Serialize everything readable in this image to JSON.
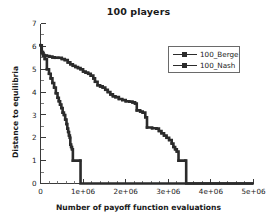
{
  "chart_data": {
    "type": "line",
    "title": "100 players",
    "xlabel": "Number of payoff function evaluations",
    "ylabel": "Distance to equilibria",
    "xlim": [
      0,
      5000000
    ],
    "ylim": [
      0,
      7
    ],
    "grid": false,
    "legend_position": "upper-right",
    "xticks": [
      0,
      1000000,
      2000000,
      3000000,
      4000000,
      5000000
    ],
    "xticklabels": [
      "0",
      "1e+06",
      "2e+06",
      "3e+06",
      "4e+06",
      "5e+06"
    ],
    "yticks": [
      0,
      1,
      2,
      3,
      4,
      5,
      6,
      7
    ],
    "yticklabels": [
      "0",
      "1",
      "2",
      "3",
      "4",
      "5",
      "6",
      "7"
    ],
    "series": [
      {
        "name": "100_Berge",
        "marker": "square-line",
        "color": "#2b2b2b",
        "points": [
          [
            0,
            6.05
          ],
          [
            20000,
            5.75
          ],
          [
            45000,
            5.7
          ],
          [
            70000,
            5.62
          ],
          [
            100000,
            5.6
          ],
          [
            150000,
            5.58
          ],
          [
            210000,
            5.55
          ],
          [
            280000,
            5.52
          ],
          [
            340000,
            5.5
          ],
          [
            420000,
            5.5
          ],
          [
            500000,
            5.45
          ],
          [
            570000,
            5.4
          ],
          [
            640000,
            5.3
          ],
          [
            700000,
            5.22
          ],
          [
            760000,
            5.15
          ],
          [
            820000,
            5.1
          ],
          [
            880000,
            5.05
          ],
          [
            940000,
            5.0
          ],
          [
            1000000,
            4.9
          ],
          [
            1060000,
            4.85
          ],
          [
            1120000,
            4.8
          ],
          [
            1180000,
            4.72
          ],
          [
            1240000,
            4.6
          ],
          [
            1280000,
            4.45
          ],
          [
            1340000,
            4.3
          ],
          [
            1400000,
            4.25
          ],
          [
            1460000,
            4.2
          ],
          [
            1520000,
            4.1
          ],
          [
            1580000,
            4.0
          ],
          [
            1640000,
            3.9
          ],
          [
            1700000,
            3.82
          ],
          [
            1760000,
            3.78
          ],
          [
            1840000,
            3.7
          ],
          [
            1920000,
            3.65
          ],
          [
            2000000,
            3.6
          ],
          [
            2080000,
            3.58
          ],
          [
            2160000,
            3.55
          ],
          [
            2220000,
            3.5
          ],
          [
            2260000,
            3.2
          ],
          [
            2340000,
            3.15
          ],
          [
            2400000,
            3.1
          ],
          [
            2460000,
            2.9
          ],
          [
            2500000,
            2.45
          ],
          [
            2620000,
            2.42
          ],
          [
            2720000,
            2.4
          ],
          [
            2780000,
            2.3
          ],
          [
            2840000,
            2.2
          ],
          [
            2900000,
            2.1
          ],
          [
            2960000,
            2.0
          ],
          [
            3020000,
            1.9
          ],
          [
            3080000,
            1.75
          ],
          [
            3120000,
            1.6
          ],
          [
            3160000,
            1.5
          ],
          [
            3200000,
            1.4
          ],
          [
            3240000,
            1.0
          ],
          [
            3400000,
            1.0
          ],
          [
            3420000,
            0.0
          ],
          [
            5000000,
            0.0
          ]
        ]
      },
      {
        "name": "100_Nash",
        "marker": "square-line",
        "color": "#2b2b2b",
        "points": [
          [
            0,
            6.05
          ],
          [
            30000,
            5.75
          ],
          [
            60000,
            5.6
          ],
          [
            100000,
            5.45
          ],
          [
            150000,
            5.0
          ],
          [
            200000,
            4.8
          ],
          [
            240000,
            4.6
          ],
          [
            280000,
            4.4
          ],
          [
            320000,
            4.2
          ],
          [
            360000,
            3.95
          ],
          [
            400000,
            3.75
          ],
          [
            430000,
            3.6
          ],
          [
            460000,
            3.45
          ],
          [
            490000,
            3.3
          ],
          [
            520000,
            3.1
          ],
          [
            550000,
            3.0
          ],
          [
            580000,
            2.8
          ],
          [
            610000,
            2.6
          ],
          [
            630000,
            2.4
          ],
          [
            650000,
            2.25
          ],
          [
            670000,
            2.1
          ],
          [
            690000,
            2.0
          ],
          [
            700000,
            1.7
          ],
          [
            720000,
            1.6
          ],
          [
            740000,
            1.5
          ],
          [
            760000,
            1.0
          ],
          [
            930000,
            1.0
          ],
          [
            940000,
            0.0
          ],
          [
            5000000,
            0.0
          ]
        ]
      }
    ]
  },
  "legend": {
    "entries": [
      {
        "label": "100_Berge"
      },
      {
        "label": "100_Nash"
      }
    ]
  }
}
